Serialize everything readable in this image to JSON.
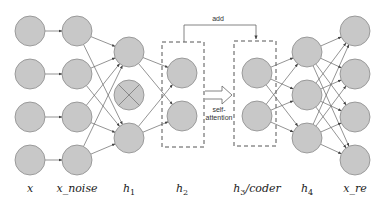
{
  "diagram": {
    "colors": {
      "node_fill": "#c8c8c8",
      "node_stroke": "#8a8a8a",
      "edge": "#555555",
      "dashed_box": "#555555",
      "label": "#222222"
    },
    "layers": [
      {
        "id": "x",
        "label": "x",
        "cx": 30,
        "nodes": [
          31,
          74,
          117,
          160
        ]
      },
      {
        "id": "x_noise",
        "label": "x_noise",
        "cx": 77,
        "nodes": [
          31,
          74,
          117,
          160
        ]
      },
      {
        "id": "h1",
        "label": "h",
        "sub": "1",
        "cx": 129,
        "nodes": [
          52,
          95,
          138
        ],
        "dropped_index": 1
      },
      {
        "id": "h2",
        "label": "h",
        "sub": "2",
        "cx": 182,
        "nodes": [
          73,
          116
        ]
      },
      {
        "id": "h3",
        "label": "h",
        "sub": "3",
        "suffix": "/coder",
        "cx": 257,
        "nodes": [
          73,
          116
        ]
      },
      {
        "id": "h4",
        "label": "h",
        "sub": "4",
        "cx": 307,
        "nodes": [
          52,
          95,
          138
        ]
      },
      {
        "id": "x_re",
        "label": "x_re",
        "cx": 355,
        "nodes": [
          31,
          74,
          117,
          160
        ]
      }
    ],
    "annotations": {
      "add_label": "add",
      "self_attention_line1": "self-",
      "self_attention_line2": "attention"
    }
  }
}
